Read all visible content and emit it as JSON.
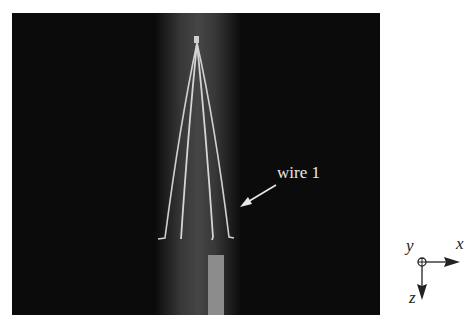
{
  "figure": {
    "annotation": "wire 1",
    "axes": {
      "x": "x",
      "y": "y",
      "z": "z"
    },
    "colors": {
      "background": "#0b0b0b",
      "wire": "#d8d8d8",
      "rod": "#8a8a8a",
      "glow": "#505050"
    }
  }
}
